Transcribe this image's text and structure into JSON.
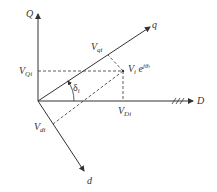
{
  "diagram": {
    "type": "phasor-reference-frame",
    "axes": {
      "Q": "Q",
      "D": "D",
      "q": "q",
      "d": "d"
    },
    "labels": {
      "V_qi": {
        "base": "V",
        "sub": "qi"
      },
      "V_Qi": {
        "base": "V",
        "sub": "Qi"
      },
      "V_Di": {
        "base": "V",
        "sub": "Di"
      },
      "V_di": {
        "base": "V",
        "sub": "di"
      },
      "phasor": {
        "base": "V",
        "sub": "i",
        "exp_base": "e",
        "exp": "jθ",
        "exp_sub": "i"
      },
      "angle": {
        "base": "δ",
        "sub": "i"
      }
    },
    "colors": {
      "line": "#333333",
      "background": "#ffffff"
    }
  }
}
